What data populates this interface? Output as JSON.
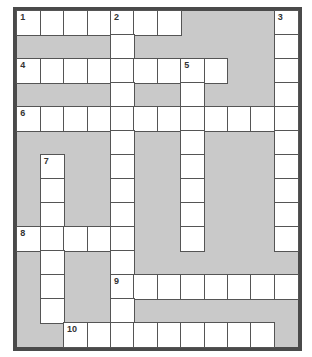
{
  "puzzle": {
    "type": "crossword",
    "rows": 14,
    "cols": 12,
    "colors": {
      "frame": "#4a4a4a",
      "block": "#c9c9c9",
      "cell": "#ffffff",
      "cell_border": "#555555"
    },
    "white_cells": {
      "0": [
        0,
        1,
        2,
        3,
        4,
        5,
        6,
        11
      ],
      "1": [
        4,
        11
      ],
      "2": [
        0,
        1,
        2,
        3,
        4,
        5,
        6,
        7,
        8,
        11
      ],
      "3": [
        4,
        7,
        11
      ],
      "4": [
        0,
        1,
        2,
        3,
        4,
        5,
        6,
        7,
        8,
        9,
        10,
        11
      ],
      "5": [
        4,
        7,
        11
      ],
      "6": [
        1,
        4,
        7,
        11
      ],
      "7": [
        1,
        4,
        7,
        11
      ],
      "8": [
        1,
        4,
        7,
        11
      ],
      "9": [
        0,
        1,
        2,
        3,
        4,
        7,
        11
      ],
      "10": [
        1,
        4
      ],
      "11": [
        1,
        4,
        5,
        6,
        7,
        8,
        9,
        10,
        11
      ],
      "12": [
        1,
        4
      ],
      "13": [
        2,
        3,
        4,
        5,
        6,
        7,
        8,
        9,
        10
      ]
    },
    "numbers": [
      {
        "label": "1",
        "row": 0,
        "col": 0
      },
      {
        "label": "2",
        "row": 0,
        "col": 4
      },
      {
        "label": "3",
        "row": 0,
        "col": 11
      },
      {
        "label": "4",
        "row": 2,
        "col": 0
      },
      {
        "label": "5",
        "row": 2,
        "col": 7
      },
      {
        "label": "6",
        "row": 4,
        "col": 0
      },
      {
        "label": "7",
        "row": 6,
        "col": 1
      },
      {
        "label": "8",
        "row": 9,
        "col": 0
      },
      {
        "label": "9",
        "row": 11,
        "col": 4
      },
      {
        "label": "10",
        "row": 13,
        "col": 2
      }
    ],
    "entries": {
      "across": [
        {
          "number": "1",
          "row": 0,
          "col": 0,
          "length": 7
        },
        {
          "number": "4",
          "row": 2,
          "col": 0,
          "length": 9
        },
        {
          "number": "6",
          "row": 4,
          "col": 0,
          "length": 12
        },
        {
          "number": "8",
          "row": 9,
          "col": 0,
          "length": 5
        },
        {
          "number": "9",
          "row": 11,
          "col": 4,
          "length": 8
        },
        {
          "number": "10",
          "row": 13,
          "col": 2,
          "length": 9
        }
      ],
      "down": [
        {
          "number": "2",
          "row": 0,
          "col": 4,
          "length": 14
        },
        {
          "number": "3",
          "row": 0,
          "col": 11,
          "length": 10
        },
        {
          "number": "5",
          "row": 2,
          "col": 7,
          "length": 8
        },
        {
          "number": "7",
          "row": 6,
          "col": 1,
          "length": 7
        }
      ]
    }
  }
}
